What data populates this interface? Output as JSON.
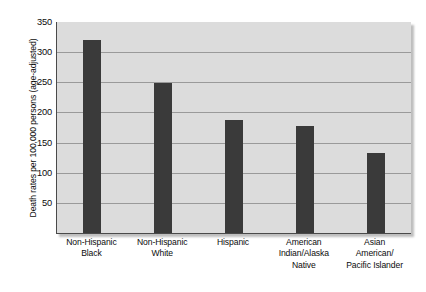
{
  "chart_data": {
    "type": "bar",
    "title": "",
    "xlabel": "",
    "ylabel": "Death rates per 100,000 persons (age-adjusted)",
    "categories": [
      "Non-Hispanic Black",
      "Non-Hispanic White",
      "Hispanic",
      "American Indian/Alaska Native",
      "Asian American/ Pacific Islander"
    ],
    "category_lines": [
      [
        "Non-Hispanic",
        "Black"
      ],
      [
        "Non-Hispanic",
        "White"
      ],
      [
        "Hispanic"
      ],
      [
        "American",
        "Indian/Alaska",
        "Native"
      ],
      [
        "Asian",
        "American/",
        "Pacific Islander"
      ]
    ],
    "values": [
      320,
      249,
      188,
      177,
      132
    ],
    "ylim": [
      0,
      350
    ],
    "yticks": [
      0,
      50,
      100,
      150,
      200,
      250,
      300,
      350
    ],
    "ytick_labels": [
      "",
      "50",
      "100",
      "150",
      "200",
      "250",
      "300",
      "350"
    ],
    "grid": true,
    "legend": "none",
    "bar_color": "#3a3a3a",
    "plot_background": "#dcdcdc",
    "gridline_color": "#9a9a9a",
    "axis_color": "#4a4a4a"
  }
}
